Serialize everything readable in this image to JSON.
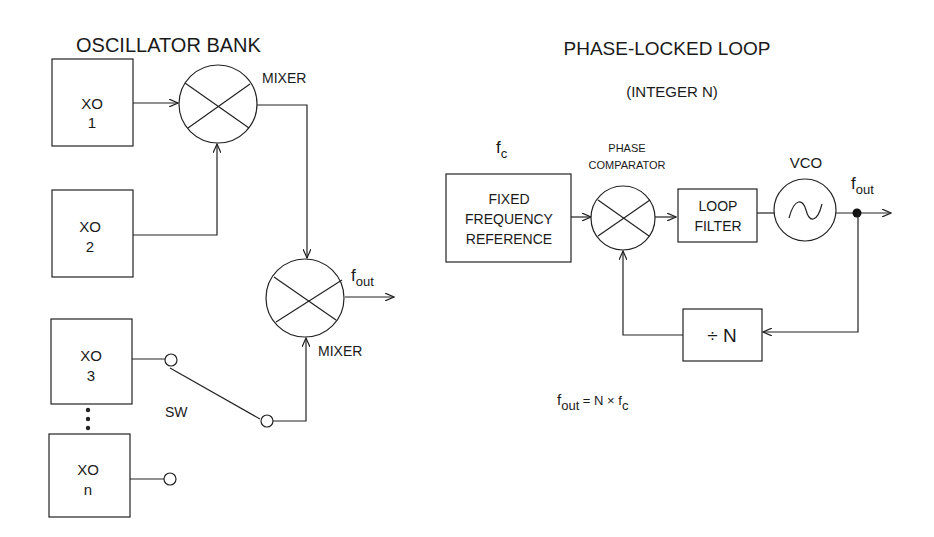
{
  "left": {
    "title": "OSCILLATOR BANK",
    "oscillators": [
      {
        "name": "XO",
        "index": "1"
      },
      {
        "name": "XO",
        "index": "2"
      },
      {
        "name": "XO",
        "index": "3"
      },
      {
        "name": "XO",
        "index": "n"
      }
    ],
    "mixer1_label": "MIXER",
    "mixer2_label": "MIXER",
    "switch_label": "SW",
    "output_label": {
      "base": "f",
      "sub": "out"
    }
  },
  "right": {
    "title": "PHASE-LOCKED LOOP",
    "subtitle": "(INTEGER N)",
    "reference_label": {
      "base": "f",
      "sub": "c"
    },
    "reference_box": [
      "FIXED",
      "FREQUENCY",
      "REFERENCE"
    ],
    "comparator_label": [
      "PHASE",
      "COMPARATOR"
    ],
    "loop_filter": [
      "LOOP",
      "FILTER"
    ],
    "vco_label": "VCO",
    "output_label": {
      "base": "f",
      "sub": "out"
    },
    "divider": "÷ N",
    "equation": {
      "lhs_base": "f",
      "lhs_sub": "out",
      "mid": " = N × f",
      "rhs_sub": "c"
    }
  }
}
